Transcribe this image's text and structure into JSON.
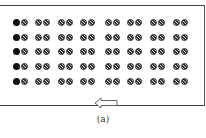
{
  "diagram": {
    "rows": 5,
    "pairs_per_row": 8,
    "first_dot_color": "#111111",
    "hatched_dot_description": "cross-hatched grey circle",
    "arrow_direction": "left",
    "caption": "(a)"
  }
}
